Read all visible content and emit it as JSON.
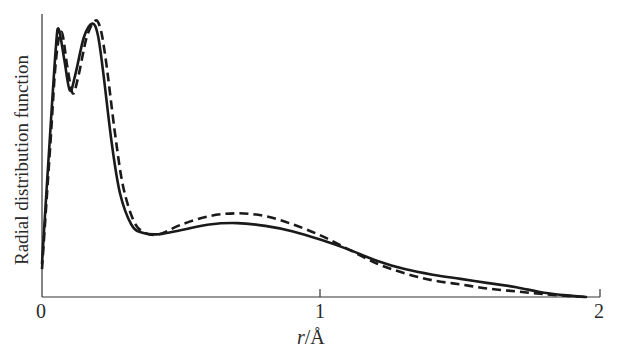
{
  "chart_data": {
    "type": "line",
    "title": "",
    "xlabel": "r/Å",
    "xlabel_var": "r",
    "xlabel_unit": "/Å",
    "ylabel": "Radial distribution function",
    "xlim": [
      0,
      2
    ],
    "ylim": [
      0,
      1
    ],
    "xticks": [
      "0",
      "1",
      "2"
    ],
    "yticks": [],
    "grid": false,
    "legend": null,
    "series": [
      {
        "name": "solid",
        "style": "solid",
        "x": [
          0.0,
          0.03,
          0.05,
          0.06,
          0.08,
          0.1,
          0.12,
          0.15,
          0.18,
          0.2,
          0.22,
          0.25,
          0.28,
          0.32,
          0.36,
          0.42,
          0.5,
          0.6,
          0.7,
          0.8,
          0.9,
          1.0,
          1.1,
          1.2,
          1.3,
          1.4,
          1.5,
          1.6,
          1.7,
          1.8,
          1.9,
          1.95
        ],
        "y": [
          0.12,
          0.6,
          0.9,
          0.96,
          0.85,
          0.74,
          0.8,
          0.93,
          0.98,
          0.94,
          0.8,
          0.55,
          0.37,
          0.26,
          0.23,
          0.225,
          0.24,
          0.26,
          0.265,
          0.255,
          0.235,
          0.205,
          0.17,
          0.13,
          0.1,
          0.08,
          0.065,
          0.05,
          0.035,
          0.015,
          0.004,
          0.0
        ]
      },
      {
        "name": "dashed",
        "style": "dashed",
        "x": [
          0.0,
          0.03,
          0.05,
          0.07,
          0.09,
          0.11,
          0.13,
          0.16,
          0.19,
          0.21,
          0.23,
          0.26,
          0.29,
          0.33,
          0.37,
          0.42,
          0.5,
          0.6,
          0.7,
          0.8,
          0.9,
          1.0,
          1.1,
          1.2,
          1.3,
          1.4,
          1.5,
          1.6,
          1.7,
          1.8,
          1.9,
          1.95
        ],
        "y": [
          0.1,
          0.55,
          0.85,
          0.95,
          0.83,
          0.73,
          0.79,
          0.93,
          0.99,
          0.96,
          0.84,
          0.6,
          0.4,
          0.27,
          0.23,
          0.225,
          0.26,
          0.29,
          0.3,
          0.29,
          0.26,
          0.22,
          0.17,
          0.12,
          0.085,
          0.06,
          0.045,
          0.03,
          0.02,
          0.01,
          0.003,
          0.0
        ]
      }
    ]
  },
  "axis": {
    "x_tick_labels": [
      "0",
      "1",
      "2"
    ],
    "x_title_var": "r",
    "x_title_unit": "/Å",
    "y_title": "Radial distribution function"
  }
}
